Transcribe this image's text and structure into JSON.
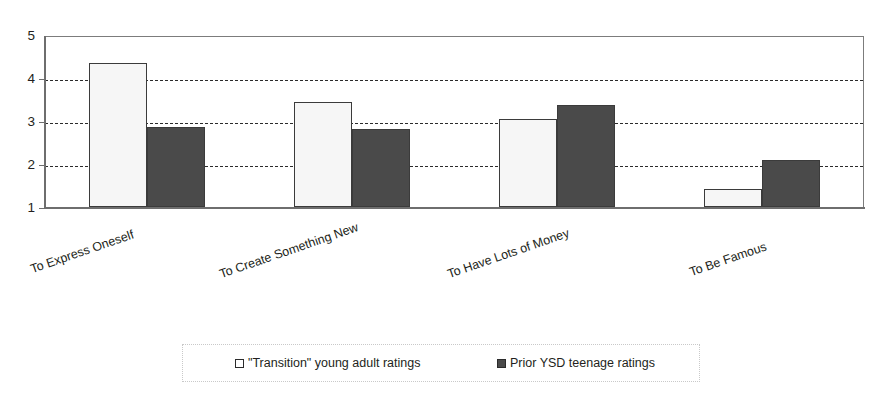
{
  "chart_data": {
    "type": "bar",
    "title": "",
    "subtitle": "",
    "xlabel": "",
    "ylabel": "",
    "ylim": [
      1,
      5
    ],
    "yticks": [
      1,
      2,
      3,
      4,
      5
    ],
    "ytick_labels": [
      "1",
      "2",
      "3",
      "4",
      "5"
    ],
    "grid": true,
    "grid_axis": "y",
    "grid_style": "dashed",
    "legend_position": "bottom",
    "categories": [
      "To Express Oneself",
      "To Create Something New",
      "To Have Lots of Money",
      "To Be Famous"
    ],
    "series": [
      {
        "name": "\"Transition\" young adult ratings",
        "color": "#f6f6f6",
        "edge_color": "#3b3b3b",
        "swatch": "light",
        "values": [
          4.35,
          3.45,
          3.05,
          1.42
        ]
      },
      {
        "name": "Prior YSD teenage ratings",
        "color": "#4a4a4a",
        "edge_color": "#3b3b3b",
        "swatch": "dark",
        "values": [
          2.86,
          2.82,
          3.38,
          2.1
        ]
      }
    ]
  },
  "legend": {
    "items": [
      {
        "label": "\"Transition\" young adult ratings",
        "swatch": "light"
      },
      {
        "label": "Prior YSD teenage ratings",
        "swatch": "dark"
      }
    ]
  },
  "axis": {
    "y_tick_labels": [
      "1",
      "2",
      "3",
      "4",
      "5"
    ]
  }
}
